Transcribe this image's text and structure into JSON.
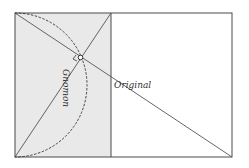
{
  "diagram": {
    "title": "",
    "labels": {
      "gnomon": "Gnomon",
      "original": "Original"
    },
    "colors": {
      "stroke": "#4a4a4a",
      "gnomon_fill": "#e9e9e9",
      "background": "#ffffff"
    },
    "elements": [
      "outer-rectangle",
      "gnomon-shaded-rectangle",
      "main-diagonal",
      "gnomon-diagonal",
      "dashed-semicircle",
      "right-angle-marker",
      "intersection-point"
    ]
  }
}
